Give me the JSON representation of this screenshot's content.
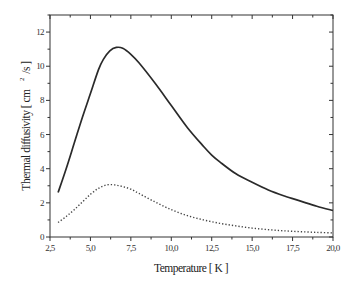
{
  "chart_data": {
    "type": "line",
    "title": "",
    "xlabel": "Temperature [ K ]",
    "ylabel": "Thermal diffusivity [ cm 2 /s ]",
    "ylabel_parts": {
      "main": "Thermal diffusivity [ cm",
      "sup": "2",
      "tail": "/s ]"
    },
    "xlim": [
      2.5,
      20.0
    ],
    "ylim": [
      0,
      13
    ],
    "x_ticks": [
      2.5,
      5.0,
      7.5,
      10.0,
      12.5,
      15.0,
      17.5,
      20.0
    ],
    "x_tick_labels": [
      "2,5",
      "5,0",
      "7,5",
      "10,0",
      "12,5",
      "15,0",
      "17,5",
      "20,0"
    ],
    "y_ticks": [
      0,
      2,
      4,
      6,
      8,
      10,
      12
    ],
    "y_tick_labels": [
      "0",
      "2",
      "4",
      "6",
      "8",
      "10",
      "12"
    ],
    "grid": false,
    "legend": null,
    "series": [
      {
        "name": "solid curve",
        "style": "solid",
        "color": "#2a2a2a",
        "x": [
          3.0,
          3.5,
          4.0,
          4.5,
          5.0,
          5.5,
          5.8,
          6.2,
          6.6,
          7.0,
          7.5,
          8.0,
          9.0,
          10.0,
          11.0,
          12.0,
          12.5,
          13.0,
          14.0,
          15.0,
          16.0,
          17.0,
          18.0,
          19.0,
          20.0
        ],
        "y": [
          2.6,
          4.0,
          5.5,
          7.0,
          8.4,
          9.8,
          10.4,
          10.9,
          11.1,
          11.05,
          10.7,
          10.2,
          9.0,
          7.7,
          6.4,
          5.3,
          4.8,
          4.4,
          3.7,
          3.2,
          2.75,
          2.4,
          2.1,
          1.8,
          1.55
        ]
      },
      {
        "name": "dotted curve",
        "style": "dotted",
        "color": "#444444",
        "x": [
          3.0,
          3.5,
          4.0,
          4.5,
          5.0,
          5.5,
          6.0,
          6.5,
          7.0,
          7.5,
          8.0,
          9.0,
          10.0,
          11.0,
          12.0,
          13.0,
          14.0,
          15.0,
          16.0,
          17.0,
          18.0,
          19.0,
          20.0
        ],
        "y": [
          0.85,
          1.2,
          1.6,
          2.05,
          2.5,
          2.85,
          3.05,
          3.05,
          2.95,
          2.8,
          2.55,
          2.05,
          1.6,
          1.25,
          1.0,
          0.8,
          0.65,
          0.52,
          0.43,
          0.36,
          0.31,
          0.27,
          0.24
        ]
      }
    ]
  }
}
